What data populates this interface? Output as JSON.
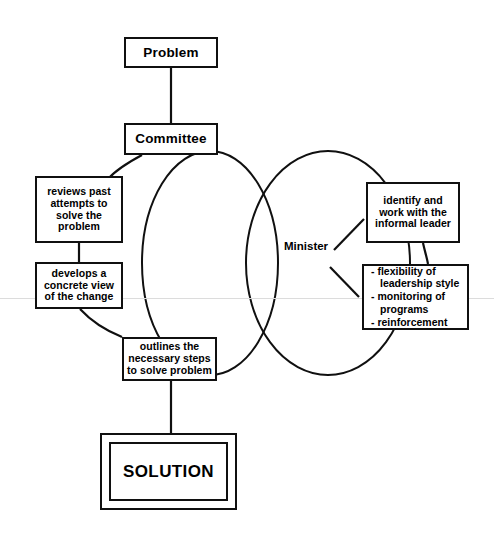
{
  "diagram": {
    "background_color": "#ffffff",
    "line_color": "#101010",
    "nodes": {
      "problem": {
        "label": "Problem"
      },
      "committee": {
        "label": "Committee"
      },
      "reviews": {
        "label": "reviews past attempts to solve the problem"
      },
      "develops": {
        "label": "develops a concrete view of the change"
      },
      "outlines": {
        "label": "outlines the necessary steps to solve problem"
      },
      "identify": {
        "label": "identify and work with the informal leader"
      },
      "practices": {
        "items": [
          "flexibility of leadership style",
          "monitoring of programs",
          "reinforcement"
        ]
      },
      "solution": {
        "label": "SOLUTION"
      }
    },
    "labels": {
      "minister": "Minister"
    },
    "venn": {
      "left_ellipse": {
        "cx": 210,
        "cy": 263,
        "rx": 68,
        "ry": 112
      },
      "right_ellipse": {
        "cx": 328,
        "cy": 263,
        "rx": 82,
        "ry": 112
      }
    }
  }
}
